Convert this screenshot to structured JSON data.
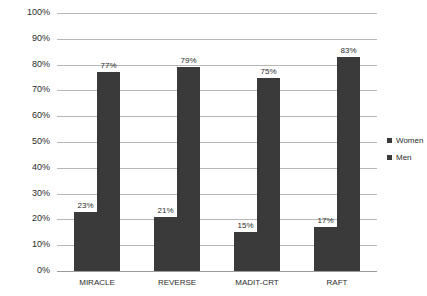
{
  "chart_data": {
    "type": "bar",
    "title": "",
    "subtitle": "",
    "xlabel": "",
    "ylabel": "",
    "categories": [
      "MIRACLE",
      "REVERSE",
      "MADIT-CRT",
      "RAFT"
    ],
    "series": [
      {
        "name": "Women",
        "values": [
          23,
          21,
          15,
          17
        ],
        "labels": [
          "23%",
          "21%",
          "15%",
          "17%"
        ],
        "color": "#3a3a3a"
      },
      {
        "name": "Men",
        "values": [
          77,
          79,
          75,
          83
        ],
        "labels": [
          "77%",
          "79%",
          "75%",
          "83%"
        ],
        "color": "#3a3a3a"
      }
    ],
    "ylim": [
      0,
      100
    ],
    "ytick_labels": [
      "100%",
      "90%",
      "80%",
      "70%",
      "60%",
      "50%",
      "40%",
      "30%",
      "20%",
      "10%",
      "0%"
    ],
    "ytick_values": [
      100,
      90,
      80,
      70,
      60,
      50,
      40,
      30,
      20,
      10,
      0
    ],
    "grid": true,
    "legend_position": "right",
    "value_suffix": "%"
  },
  "legend": {
    "items": [
      {
        "label": "Women",
        "color": "#3a3a3a"
      },
      {
        "label": "Men",
        "color": "#3a3a3a"
      }
    ]
  },
  "colors": {
    "bar": "#3a3a3a",
    "gridline": "#b7b7b7",
    "baseline": "#9a9a9a",
    "text": "#2b2b2b",
    "background": "#ffffff"
  }
}
